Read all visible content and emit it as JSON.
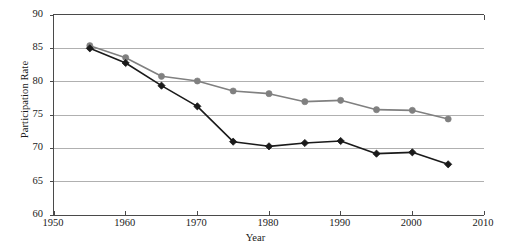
{
  "figure": {
    "top_edge_artifact": "",
    "background_color": "#ffffff"
  },
  "chart_data": {
    "type": "line",
    "title": "",
    "subtitle": "",
    "xlabel": "Year",
    "ylabel": "Participation Rate",
    "xlim": [
      1950,
      2010
    ],
    "ylim": [
      60,
      90
    ],
    "xticks": [
      1950,
      1960,
      1970,
      1980,
      1990,
      2000,
      2010
    ],
    "yticks": [
      60,
      65,
      70,
      75,
      80,
      85,
      90
    ],
    "xtick_labels": [
      "1950",
      "1960",
      "1970",
      "1980",
      "1990",
      "2000",
      "2010"
    ],
    "ytick_labels": [
      "60",
      "65",
      "70",
      "75",
      "80",
      "85",
      "90"
    ],
    "grid": "horizontal",
    "grid_color": "#b0b0b0",
    "axis_color": "#4a4a4a",
    "legend": "none",
    "legend_position": "none",
    "annotations": [],
    "x": [
      1955,
      1960,
      1965,
      1970,
      1975,
      1980,
      1985,
      1990,
      1995,
      2000,
      2005
    ],
    "series": [
      {
        "name": "gray-series",
        "color": "#808080",
        "marker": "circle",
        "values": [
          85.4,
          83.6,
          80.8,
          80.1,
          78.6,
          78.2,
          77.0,
          77.2,
          75.8,
          75.7,
          74.4
        ]
      },
      {
        "name": "black-series",
        "color": "#1a1a1a",
        "marker": "diamond",
        "values": [
          85.0,
          82.8,
          79.4,
          76.3,
          71.0,
          70.3,
          70.8,
          71.1,
          69.2,
          69.4,
          67.6
        ]
      }
    ]
  }
}
